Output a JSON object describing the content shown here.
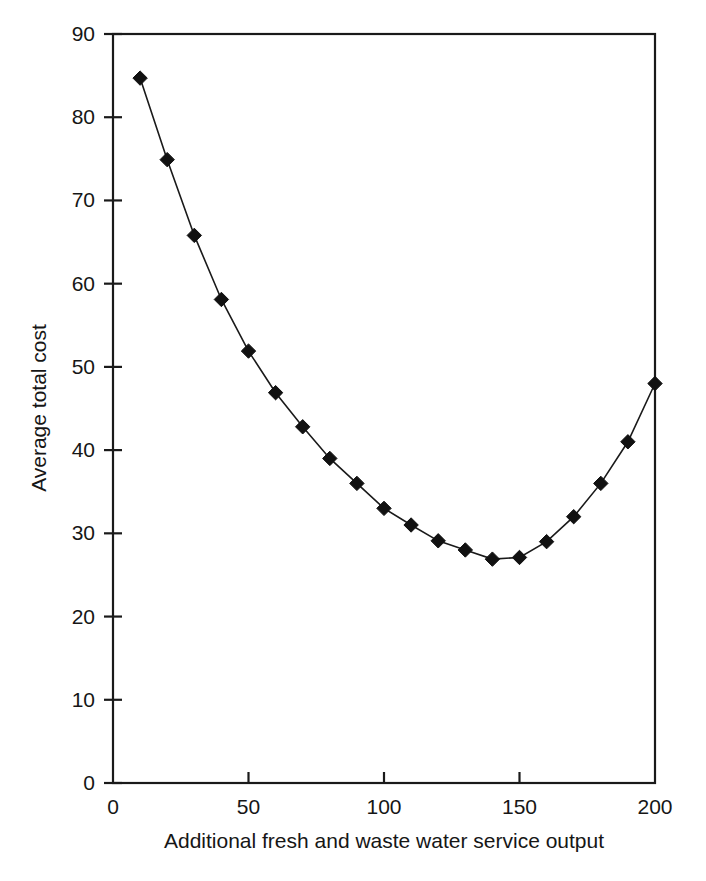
{
  "chart_data": {
    "type": "line",
    "title": "",
    "subtitle": "",
    "xlabel": "Additional fresh and waste water service output",
    "ylabel": "Average total cost",
    "xlim": [
      0,
      200
    ],
    "ylim": [
      0,
      90
    ],
    "xticks": [
      0,
      50,
      100,
      150,
      200
    ],
    "yticks": [
      0,
      10,
      20,
      30,
      40,
      50,
      60,
      70,
      80,
      90
    ],
    "xticklabels": [
      "0",
      "50",
      "100",
      "150",
      "200"
    ],
    "yticklabels": [
      "0",
      "10",
      "20",
      "30",
      "40",
      "50",
      "60",
      "70",
      "80",
      "90"
    ],
    "grid": false,
    "legend": false,
    "legend_position": "none",
    "marker": "diamond",
    "marker_color": "#111111",
    "line_color": "#1a1a1a",
    "x": [
      10,
      20,
      30,
      40,
      50,
      60,
      70,
      80,
      90,
      100,
      110,
      120,
      130,
      140,
      150,
      160,
      170,
      180,
      190,
      200
    ],
    "values": [
      84.7,
      74.9,
      65.8,
      58.1,
      51.9,
      46.9,
      42.8,
      39.0,
      36.0,
      33.0,
      31.0,
      29.1,
      28.0,
      26.9,
      27.1,
      29.0,
      32.0,
      36.0,
      41.0,
      48.0
    ],
    "series": [
      {
        "name": "Average total cost",
        "values": [
          84.7,
          74.9,
          65.8,
          58.1,
          51.9,
          46.9,
          42.8,
          39.0,
          36.0,
          33.0,
          31.0,
          29.1,
          28.0,
          26.9,
          27.1,
          29.0,
          32.0,
          36.0,
          41.0,
          48.0
        ]
      }
    ],
    "annotations": []
  },
  "plot": {
    "frame_color": "#1a1a1a",
    "background": "#ffffff"
  }
}
